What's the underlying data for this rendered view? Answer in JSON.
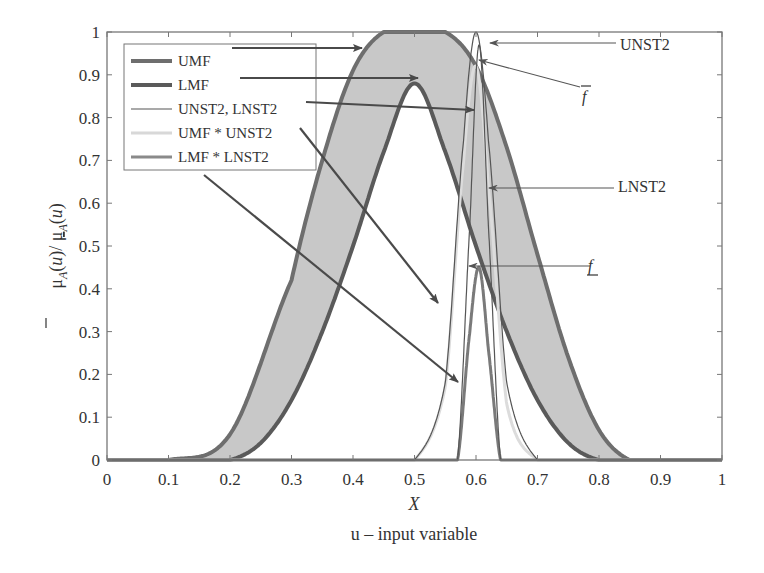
{
  "chart_data": {
    "type": "line",
    "title": "",
    "xlabel": "X",
    "xlabel_sub": "u – input variable",
    "ylabel": "μ̄A(u) / μA(u)",
    "xlim": [
      0,
      1
    ],
    "ylim": [
      0,
      1
    ],
    "grid": false,
    "legend_position": "upper left",
    "x_ticks": [
      "0",
      "0.1",
      "0.2",
      "0.3",
      "0.4",
      "0.5",
      "0.6",
      "0.7",
      "0.8",
      "0.9",
      "1"
    ],
    "y_ticks": [
      "0",
      "0.1",
      "0.2",
      "0.3",
      "0.4",
      "0.5",
      "0.6",
      "0.7",
      "0.8",
      "0.9",
      "1"
    ],
    "legend": [
      {
        "label": "UMF",
        "color": "#6e6e6e",
        "width": 4
      },
      {
        "label": "LMF",
        "color": "#5a5a5a",
        "width": 4
      },
      {
        "label": "UNST2, LNST2",
        "color": "#555555",
        "width": 1.2
      },
      {
        "label": "UMF * UNST2",
        "color": "#d8d8d8",
        "width": 3
      },
      {
        "label": "LMF * LNST2",
        "color": "#8a8a8a",
        "width": 3
      }
    ],
    "series": [
      {
        "name": "UMF",
        "shape": "flat-top gaussian",
        "plateau": [
          0.45,
          0.55
        ],
        "peak": 1.0,
        "x": [
          0.1,
          0.2,
          0.3,
          0.35,
          0.4,
          0.45,
          0.5,
          0.55,
          0.6,
          0.65,
          0.7,
          0.75,
          0.8,
          0.85
        ],
        "y": [
          0.0,
          0.06,
          0.42,
          0.7,
          0.91,
          1.0,
          1.0,
          1.0,
          0.92,
          0.73,
          0.48,
          0.24,
          0.07,
          0.0
        ]
      },
      {
        "name": "LMF",
        "shape": "triangular-gaussian",
        "peak_x": 0.5,
        "peak": 0.88,
        "x": [
          0.2,
          0.25,
          0.3,
          0.35,
          0.4,
          0.45,
          0.5,
          0.55,
          0.6,
          0.65,
          0.7,
          0.75,
          0.8
        ],
        "y": [
          0.0,
          0.04,
          0.14,
          0.3,
          0.5,
          0.72,
          0.88,
          0.72,
          0.5,
          0.3,
          0.14,
          0.04,
          0.0
        ]
      },
      {
        "name": "UNST2",
        "center": 0.6,
        "peak": 1.0,
        "x": [
          0.5,
          0.55,
          0.58,
          0.6,
          0.62,
          0.65,
          0.7
        ],
        "y": [
          0.0,
          0.18,
          0.75,
          1.0,
          0.75,
          0.18,
          0.0
        ]
      },
      {
        "name": "LNST2",
        "center": 0.605,
        "peak": 0.97,
        "x": [
          0.57,
          0.59,
          0.605,
          0.62,
          0.64
        ],
        "y": [
          0.0,
          0.55,
          0.97,
          0.55,
          0.0
        ]
      },
      {
        "name": "UMF * UNST2",
        "x": [
          0.5,
          0.55,
          0.58,
          0.6,
          0.62,
          0.65,
          0.7
        ],
        "y": [
          0.0,
          0.17,
          0.7,
          0.92,
          0.64,
          0.13,
          0.0
        ]
      },
      {
        "name": "LMF * LNST2",
        "x": [
          0.57,
          0.59,
          0.605,
          0.62,
          0.64
        ],
        "y": [
          0.0,
          0.3,
          0.45,
          0.26,
          0.0
        ]
      }
    ],
    "annotations": [
      {
        "text": "UNST2",
        "x": 0.6,
        "y": 0.99,
        "label_px": [
          620,
          50
        ]
      },
      {
        "text": "f̄",
        "x": 0.595,
        "y": 0.93,
        "label_px": [
          582,
          102
        ]
      },
      {
        "text": "LNST2",
        "x": 0.618,
        "y": 0.63,
        "label_px": [
          618,
          192
        ]
      },
      {
        "text": "f",
        "underline": true,
        "x": 0.585,
        "y": 0.45,
        "label_px": [
          588,
          271
        ]
      }
    ],
    "colors": {
      "band_fill": "#c8c8c8",
      "axis": "#777777",
      "arrow": "#4a4a4a"
    }
  }
}
